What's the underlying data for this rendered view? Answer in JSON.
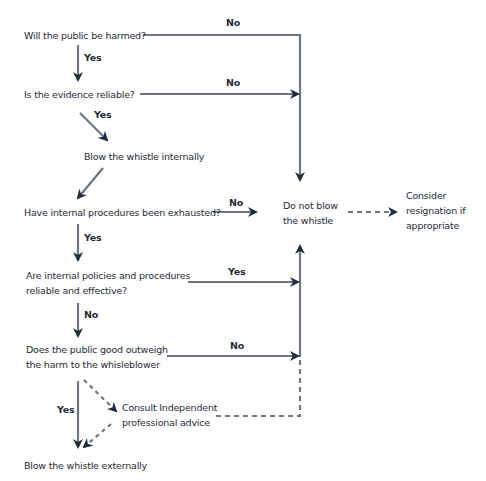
{
  "colors": {
    "text": "#1f2a38",
    "line": "#6d7682",
    "arrowhead": "#1e2d40",
    "background": "#ffffff"
  },
  "nodes": {
    "q_public_harmed": [
      "Will the public be harmed?"
    ],
    "q_evidence_reliable": [
      "Is the evidence reliable?"
    ],
    "blow_internally": [
      "Blow the whistle internally"
    ],
    "q_procedures_exhausted": [
      "Have internal procedures been exhausted?"
    ],
    "do_not_blow": [
      "Do not blow",
      "the whistle"
    ],
    "consider_resignation": [
      "Consider",
      "resignation if",
      "appropriate"
    ],
    "q_policies_reliable": [
      "Are internal policies and procedures",
      "reliable and effective?"
    ],
    "q_public_good": [
      "Does the public good outweigh",
      "the harm to the whisleblower"
    ],
    "consult_advice": [
      "Consult Independent",
      "professional advice"
    ],
    "blow_externally": [
      "Blow the whistle externally"
    ]
  },
  "edge_labels": {
    "harmed_no": "No",
    "harmed_yes": "Yes",
    "evidence_no": "No",
    "evidence_yes": "Yes",
    "exhausted_no": "No",
    "exhausted_yes": "Yes",
    "policies_yes": "Yes",
    "policies_no": "No",
    "public_good_no": "No",
    "public_good_yes": "Yes"
  }
}
